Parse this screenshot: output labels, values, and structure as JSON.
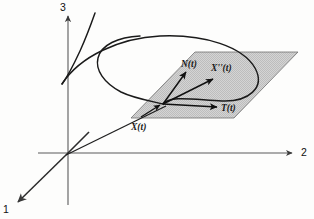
{
  "figure": {
    "axes": {
      "label_1": "1",
      "label_2": "2",
      "label_3": "3",
      "origin": [
        68,
        153
      ],
      "axis3_tip": [
        68,
        12
      ],
      "axis2_tip": [
        296,
        153
      ],
      "axis1_tip": [
        14,
        205
      ]
    },
    "plane": {
      "name": "osculating-plane",
      "fill": "#d0d0d0",
      "stroke": "#6e6e6e",
      "corners": [
        [
          195,
          52
        ],
        [
          298,
          52
        ],
        [
          234,
          118
        ],
        [
          131,
          118
        ]
      ]
    },
    "vectors": [
      {
        "label": "N(t)",
        "name": "normal-vector",
        "from": [
          163,
          104
        ],
        "to": [
          187,
          71
        ]
      },
      {
        "label": "X''(t)",
        "name": "acceleration-vector",
        "from": [
          163,
          104
        ],
        "to": [
          214,
          78
        ]
      },
      {
        "label": "T(t)",
        "name": "tangent-vector",
        "from": [
          163,
          104
        ],
        "to": [
          218,
          107
        ]
      }
    ],
    "point": {
      "label": "X(t)",
      "name": "curve-point",
      "at": [
        163,
        104
      ]
    },
    "curve": {
      "name": "space-curve",
      "stroke": "#1a1a1a",
      "description": "looping space curve passing through X(t)"
    },
    "position_ray": {
      "name": "position-vector-ray",
      "from": [
        68,
        153
      ],
      "to": [
        163,
        104
      ]
    },
    "tick_segment": {
      "name": "origin-tick-segment",
      "from": [
        68,
        153
      ],
      "to": [
        88,
        134
      ]
    },
    "colors": {
      "ink": "#1a1a1a",
      "axis": "#5a5a5a",
      "plane_fill": "#d0d0d0",
      "plane_edge": "#6e6e6e",
      "background": "#fdfdfc"
    }
  }
}
